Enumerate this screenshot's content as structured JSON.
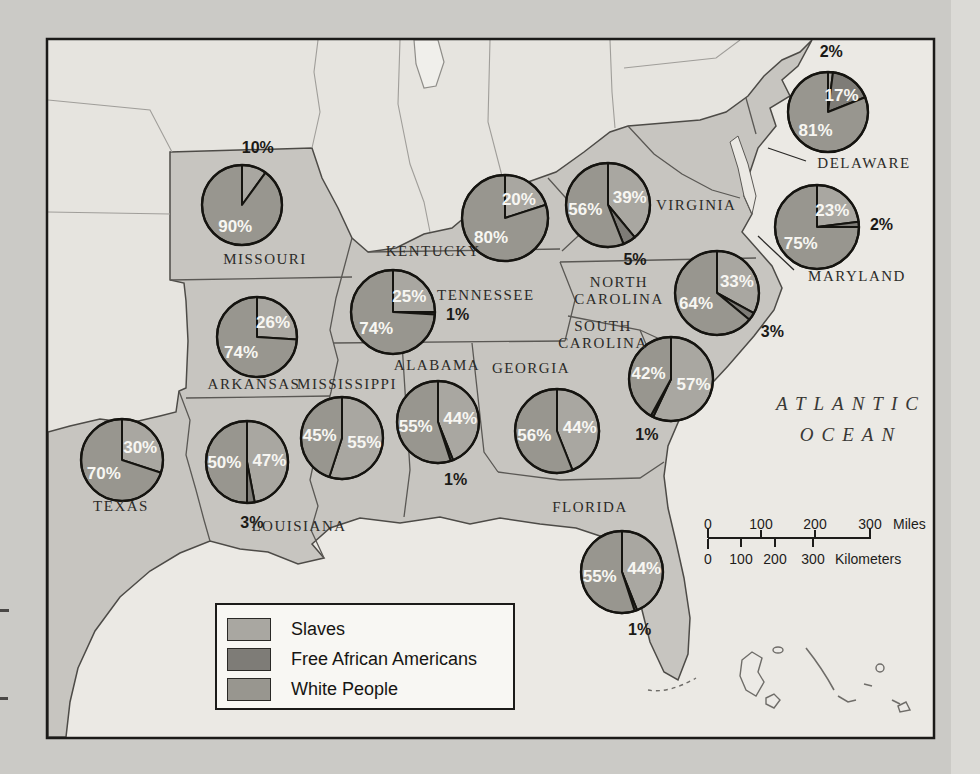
{
  "legend": {
    "items": [
      {
        "label": "Slaves",
        "color": "#a9a7a1"
      },
      {
        "label": "Free African Americans",
        "color": "#7e7c77"
      },
      {
        "label": "White People",
        "color": "#98968f"
      }
    ]
  },
  "map": {
    "ocean_label": [
      "ATLANTIC",
      "OCEAN"
    ],
    "state_labels": {
      "missouri": "MISSOURI",
      "kentucky": "KENTUCKY",
      "tennessee": "TENNESSEE",
      "virginia": "VIRGINIA",
      "north_carolina": [
        "NORTH",
        "CAROLINA"
      ],
      "south_carolina": [
        "SOUTH",
        "CAROLINA"
      ],
      "arkansas": "ARKANSAS",
      "mississippi": "MISSISSIPPI",
      "alabama": "ALABAMA",
      "georgia": "GEORGIA",
      "texas": "TEXAS",
      "louisiana": "LOUISIANA",
      "florida": "FLORIDA",
      "delaware": "DELAWARE",
      "maryland": "MARYLAND"
    }
  },
  "scale_bar": {
    "miles": [
      "0",
      "100",
      "200",
      "300"
    ],
    "miles_unit": "Miles",
    "kilometers": [
      "0",
      "100",
      "200",
      "300"
    ],
    "kilometers_unit": "Kilometers"
  },
  "chart_data": [
    {
      "type": "pie",
      "state": "MISSOURI",
      "slices": [
        {
          "group": "Slaves",
          "value": 10,
          "label": "10%"
        },
        {
          "group": "White People",
          "value": 90,
          "label": "90%"
        }
      ]
    },
    {
      "type": "pie",
      "state": "ARKANSAS",
      "slices": [
        {
          "group": "Slaves",
          "value": 26,
          "label": "26%"
        },
        {
          "group": "White People",
          "value": 74,
          "label": "74%"
        }
      ]
    },
    {
      "type": "pie",
      "state": "TEXAS",
      "slices": [
        {
          "group": "Slaves",
          "value": 30,
          "label": "30%"
        },
        {
          "group": "White People",
          "value": 70,
          "label": "70%"
        }
      ]
    },
    {
      "type": "pie",
      "state": "LOUISIANA",
      "slices": [
        {
          "group": "Slaves",
          "value": 47,
          "label": "47%"
        },
        {
          "group": "Free African Americans",
          "value": 3,
          "label": "3%"
        },
        {
          "group": "White People",
          "value": 50,
          "label": "50%"
        }
      ]
    },
    {
      "type": "pie",
      "state": "MISSISSIPPI",
      "slices": [
        {
          "group": "Slaves",
          "value": 55,
          "label": "55%"
        },
        {
          "group": "White People",
          "value": 45,
          "label": "45%"
        }
      ]
    },
    {
      "type": "pie",
      "state": "ALABAMA",
      "slices": [
        {
          "group": "Slaves",
          "value": 44,
          "label": "44%"
        },
        {
          "group": "Free African Americans",
          "value": 1,
          "label": "1%"
        },
        {
          "group": "White People",
          "value": 55,
          "label": "55%"
        }
      ]
    },
    {
      "type": "pie",
      "state": "GEORGIA",
      "slices": [
        {
          "group": "Slaves",
          "value": 44,
          "label": "44%"
        },
        {
          "group": "White People",
          "value": 56,
          "label": "56%"
        }
      ]
    },
    {
      "type": "pie",
      "state": "FLORIDA",
      "slices": [
        {
          "group": "Slaves",
          "value": 44,
          "label": "44%"
        },
        {
          "group": "Free African Americans",
          "value": 1,
          "label": "1%"
        },
        {
          "group": "White People",
          "value": 55,
          "label": "55%"
        }
      ]
    },
    {
      "type": "pie",
      "state": "SOUTH CAROLINA",
      "slices": [
        {
          "group": "Slaves",
          "value": 57,
          "label": "57%"
        },
        {
          "group": "Free African Americans",
          "value": 1,
          "label": "1%"
        },
        {
          "group": "White People",
          "value": 42,
          "label": "42%"
        }
      ]
    },
    {
      "type": "pie",
      "state": "NORTH CAROLINA",
      "slices": [
        {
          "group": "Slaves",
          "value": 33,
          "label": "33%"
        },
        {
          "group": "Free African Americans",
          "value": 3,
          "label": "3%"
        },
        {
          "group": "White People",
          "value": 64,
          "label": "64%"
        }
      ]
    },
    {
      "type": "pie",
      "state": "VIRGINIA",
      "slices": [
        {
          "group": "Slaves",
          "value": 39,
          "label": "39%"
        },
        {
          "group": "Free African Americans",
          "value": 5,
          "label": "5%"
        },
        {
          "group": "White People",
          "value": 56,
          "label": "56%"
        }
      ]
    },
    {
      "type": "pie",
      "state": "TENNESSEE",
      "slices": [
        {
          "group": "Slaves",
          "value": 25,
          "label": "25%"
        },
        {
          "group": "Free African Americans",
          "value": 1,
          "label": "1%"
        },
        {
          "group": "White People",
          "value": 74,
          "label": "74%"
        }
      ]
    },
    {
      "type": "pie",
      "state": "KENTUCKY",
      "slices": [
        {
          "group": "Slaves",
          "value": 20,
          "label": "20%"
        },
        {
          "group": "White People",
          "value": 80,
          "label": "80%"
        }
      ]
    },
    {
      "type": "pie",
      "state": "DELAWARE",
      "slices": [
        {
          "group": "Slaves",
          "value": 2,
          "label": "2%"
        },
        {
          "group": "Free African Americans",
          "value": 17,
          "label": "17%"
        },
        {
          "group": "White People",
          "value": 81,
          "label": "81%"
        }
      ]
    },
    {
      "type": "pie",
      "state": "MARYLAND",
      "slices": [
        {
          "group": "Slaves",
          "value": 23,
          "label": "23%"
        },
        {
          "group": "Free African Americans",
          "value": 2,
          "label": "2%"
        },
        {
          "group": "White People",
          "value": 75,
          "label": "75%"
        }
      ]
    }
  ]
}
